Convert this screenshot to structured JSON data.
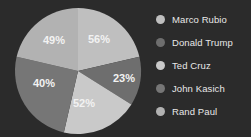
{
  "chart_data": {
    "type": "pie",
    "title": "",
    "subtitle": "",
    "xlabel": "",
    "ylabel": "",
    "grid": false,
    "legend_position": "right",
    "background_color": "#2b2b2b",
    "label_color": "#f2f2f2",
    "legend_text_color": "#e8e8e8",
    "categories": [
      "Marco Rubio",
      "Donald Trump",
      "Ted Cruz",
      "John Kasich",
      "Rand Paul"
    ],
    "values": [
      56,
      23,
      52,
      40,
      49
    ],
    "value_labels": [
      "56%",
      "23%",
      "52%",
      "40%",
      "49%"
    ],
    "colors": [
      "#bfbfbf",
      "#6e6e6e",
      "#c9c9c9",
      "#767676",
      "#b2b2b2"
    ],
    "slices": [
      {
        "name": "Marco Rubio",
        "value": 56,
        "label": "56%",
        "color": "#bfbfbf",
        "start_angle": 0,
        "end_angle": 77,
        "label_x": 99,
        "label_y": 40
      },
      {
        "name": "Donald Trump",
        "value": 23,
        "label": "23%",
        "color": "#6e6e6e",
        "start_angle": 77,
        "end_angle": 122,
        "label_x": 124,
        "label_y": 79
      },
      {
        "name": "Ted Cruz",
        "value": 52,
        "label": "52%",
        "color": "#c9c9c9",
        "start_angle": 122,
        "end_angle": 193,
        "label_x": 84,
        "label_y": 104
      },
      {
        "name": "John Kasich",
        "value": 40,
        "label": "40%",
        "color": "#767676",
        "start_angle": 193,
        "end_angle": 283,
        "label_x": 44,
        "label_y": 84
      },
      {
        "name": "Rand Paul",
        "value": 49,
        "label": "49%",
        "color": "#b2b2b2",
        "start_angle": 283,
        "end_angle": 360,
        "label_x": 54,
        "label_y": 41
      }
    ],
    "geometry": {
      "center_x": 78,
      "center_y": 71,
      "radius": 63
    }
  },
  "legend": {
    "items": [
      {
        "label": "Marco Rubio",
        "color": "#bfbfbf"
      },
      {
        "label": "Donald Trump",
        "color": "#6e6e6e"
      },
      {
        "label": "Ted Cruz",
        "color": "#c9c9c9"
      },
      {
        "label": "John Kasich",
        "color": "#767676"
      },
      {
        "label": "Rand Paul",
        "color": "#b2b2b2"
      }
    ]
  }
}
